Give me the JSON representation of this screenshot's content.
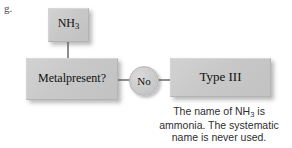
{
  "item": {
    "letter": "g."
  },
  "flowchart": {
    "nodes": [
      {
        "id": "nh3",
        "label": "NH3",
        "label_main": "NH",
        "label_sub": "3"
      },
      {
        "id": "metal",
        "label": "Metal present?",
        "line1": "Metal",
        "line2": "present?"
      },
      {
        "id": "type3",
        "label": "Type III"
      }
    ],
    "bubble": {
      "label": "No"
    },
    "connectors": [
      {
        "name": "nh3-to-metal",
        "orientation": "vertical"
      },
      {
        "name": "metal-to-no",
        "orientation": "horizontal"
      },
      {
        "name": "no-to-type3",
        "orientation": "horizontal"
      }
    ],
    "colors": {
      "node_fill": "#c8c8c8",
      "node_border": "#b4b4b4",
      "connector": "#8e8e8e",
      "text": "#101010",
      "background": "#ffffff",
      "caption_text": "#2e2e2e"
    }
  },
  "caption": {
    "line1_prefix": "The name of NH",
    "line1_sub": "3",
    "line1_suffix": " is",
    "line2": "ammonia. The systematic",
    "line3": "name is never used."
  }
}
